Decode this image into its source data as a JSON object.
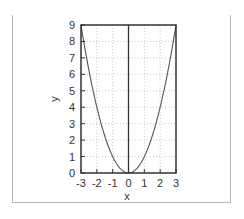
{
  "chart_data": {
    "type": "line",
    "title": "",
    "xlabel": "x",
    "ylabel": "y",
    "xlim": [
      -3,
      3
    ],
    "ylim": [
      0,
      9
    ],
    "xticks": [
      -3,
      -2,
      -1,
      0,
      1,
      2,
      3
    ],
    "yticks": [
      0,
      1,
      2,
      3,
      4,
      5,
      6,
      7,
      8,
      9
    ],
    "xtick_labels": [
      "-3",
      "-2",
      "-1",
      "0",
      "1",
      "2",
      "3"
    ],
    "ytick_labels": [
      "0",
      "1",
      "2",
      "3",
      "4",
      "5",
      "6",
      "7",
      "8",
      "9"
    ],
    "grid": true,
    "legend": null,
    "series": [
      {
        "name": "y = x^2",
        "x": [
          -3,
          -2.5,
          -2,
          -1.5,
          -1,
          -0.5,
          0,
          0.5,
          1,
          1.5,
          2,
          2.5,
          3
        ],
        "y": [
          9,
          6.25,
          4,
          2.25,
          1,
          0.25,
          0,
          0.25,
          1,
          2.25,
          4,
          6.25,
          9
        ]
      }
    ]
  },
  "colors": {
    "curve": "#555555",
    "frame": "#333333",
    "grid": "#bbbbbb",
    "outer_border": "#b8b8b8"
  }
}
